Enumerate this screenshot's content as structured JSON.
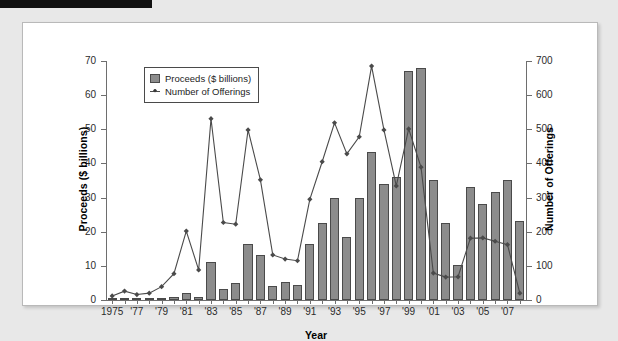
{
  "figure": {
    "x_axis_title": "Year",
    "left_axis_title": "Proceeds ($ billions)",
    "right_axis_title": "Number of Offerings"
  },
  "legend": {
    "items": [
      {
        "label": "Proceeds ($ billions)",
        "marker": "bar-swatch"
      },
      {
        "label": "Number of Offerings",
        "marker": "line-diamond-marker"
      }
    ]
  },
  "chart_data": {
    "type": "bar",
    "title": "",
    "xlabel": "Year",
    "ylabel": "Proceeds ($ billions)",
    "y2label": "Number of Offerings",
    "ylim": [
      0,
      70
    ],
    "y2lim": [
      0,
      700
    ],
    "yticks": [
      0,
      10,
      20,
      30,
      40,
      50,
      60,
      70
    ],
    "y2ticks": [
      0,
      100,
      200,
      300,
      400,
      500,
      600,
      700
    ],
    "grid": false,
    "legend_position": "top-left",
    "categories": [
      1975,
      1976,
      1977,
      1978,
      1979,
      1980,
      1981,
      1982,
      1983,
      1984,
      1985,
      1986,
      1987,
      1988,
      1989,
      1990,
      1991,
      1992,
      1993,
      1994,
      1995,
      1996,
      1997,
      1998,
      1999,
      2000,
      2001,
      2002,
      2003,
      2004,
      2005,
      2006,
      2007,
      2008
    ],
    "xtick_labels": [
      "1975",
      "'77",
      "'79",
      "'81",
      "'83",
      "'85",
      "'87",
      "'89",
      "'91",
      "'93",
      "'95",
      "'97",
      "'99",
      "'01",
      "'03",
      "'05",
      "'07"
    ],
    "xtick_years": [
      1975,
      1977,
      1979,
      1981,
      1983,
      1985,
      1987,
      1989,
      1991,
      1993,
      1995,
      1997,
      1999,
      2001,
      2003,
      2005,
      2007
    ],
    "series": [
      {
        "name": "Proceeds ($ billions)",
        "type": "bar",
        "axis": "left",
        "color": "#8c8c8c",
        "edge_color": "#4a4a4a",
        "values": [
          0.2,
          0.2,
          0.2,
          0.2,
          0.3,
          1.0,
          2.0,
          0.9,
          11.2,
          3.1,
          5.1,
          16.3,
          13.2,
          4.2,
          5.2,
          4.3,
          16.4,
          22.5,
          29.8,
          18.6,
          30.0,
          43.3,
          34.0,
          36.1,
          67.0,
          68.0,
          35.2,
          22.6,
          10.4,
          33.0,
          28.2,
          31.5,
          35.2,
          23.1
        ]
      },
      {
        "name": "Number of Offerings",
        "type": "line",
        "axis": "right",
        "color": "#4a4a4a",
        "marker": "diamond",
        "values": [
          12,
          26,
          16,
          20,
          39,
          77,
          202,
          88,
          531,
          227,
          222,
          498,
          352,
          132,
          120,
          115,
          295,
          405,
          519,
          428,
          478,
          685,
          498,
          334,
          501,
          389,
          79,
          67,
          68,
          181,
          182,
          172,
          162,
          20
        ]
      }
    ]
  }
}
